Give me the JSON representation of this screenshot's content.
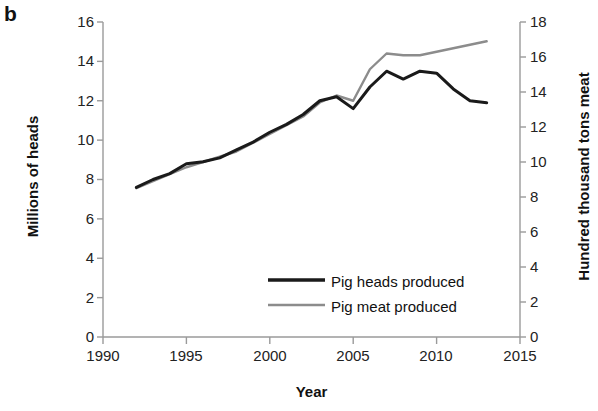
{
  "panel": {
    "label": "b"
  },
  "chart_data": {
    "type": "line",
    "title": "",
    "xlabel": "Year",
    "ylabel": "Millions of heads",
    "y2label": "Hundred thousand tons meat",
    "xlim": [
      1990,
      2015
    ],
    "ylim": [
      0,
      16
    ],
    "y2lim": [
      0,
      18
    ],
    "xticks": [
      1990,
      1995,
      2000,
      2005,
      2010,
      2015
    ],
    "yticks": [
      0,
      2,
      4,
      6,
      8,
      10,
      12,
      14,
      16
    ],
    "y2ticks": [
      0,
      2,
      4,
      6,
      8,
      10,
      12,
      14,
      16,
      18
    ],
    "grid": false,
    "legend_position": "lower-center-right",
    "x": [
      1992,
      1993,
      1994,
      1995,
      1996,
      1997,
      1998,
      1999,
      2000,
      2001,
      2002,
      2003,
      2004,
      2005,
      2006,
      2007,
      2008,
      2009,
      2010,
      2011,
      2012,
      2013
    ],
    "series": [
      {
        "name": "Pig heads produced",
        "axis": "left",
        "units": "millions of heads",
        "color": "#1a1a1a",
        "values": [
          7.6,
          8.0,
          8.3,
          8.8,
          8.9,
          9.1,
          9.5,
          9.9,
          10.4,
          10.8,
          11.3,
          12.0,
          12.2,
          11.6,
          12.7,
          13.5,
          13.1,
          13.5,
          13.4,
          12.6,
          12.0,
          11.9
        ]
      },
      {
        "name": "Pig meat produced",
        "axis": "right",
        "units": "hundred thousand tons",
        "color": "#8c8c8c",
        "values": [
          8.5,
          8.9,
          9.3,
          9.7,
          10.0,
          10.3,
          10.6,
          11.1,
          11.6,
          12.1,
          12.6,
          13.4,
          13.8,
          13.5,
          15.3,
          16.2,
          16.1,
          16.1,
          16.3,
          16.5,
          16.7,
          16.9
        ]
      }
    ]
  },
  "legend": {
    "items": [
      {
        "label": "Pig heads produced",
        "color": "#1a1a1a",
        "width": 3
      },
      {
        "label": "Pig meat produced",
        "color": "#8c8c8c",
        "width": 2.4
      }
    ]
  },
  "axes": {
    "x_tick_labels": [
      "1990",
      "1995",
      "2000",
      "2005",
      "2010",
      "2015"
    ],
    "y_left_tick_labels": [
      "16",
      "14",
      "12",
      "10",
      "8",
      "6",
      "4",
      "2",
      "0"
    ],
    "y_right_tick_labels": [
      "18",
      "16",
      "14",
      "12",
      "10",
      "8",
      "6",
      "4",
      "2",
      "0"
    ],
    "x_title": "Year",
    "y_left_title": "Millions of heads",
    "y_right_title": "Hundred thousand tons meat",
    "axis_color": "#9a9a9a"
  }
}
